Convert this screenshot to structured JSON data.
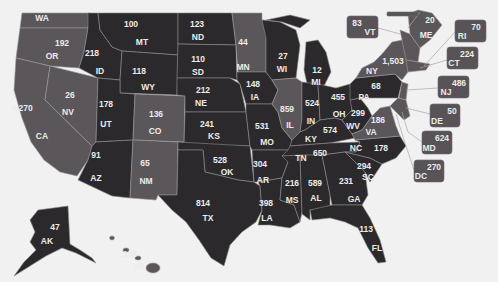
{
  "map": {
    "title": "US states value map",
    "colors": {
      "background": "#f1f1f1",
      "dark": "#2b292b",
      "medium": "#5a565a",
      "label": "#ececec"
    }
  },
  "states": {
    "WA": {
      "abbr": "WA"
    },
    "OR": {
      "abbr": "OR",
      "value": "192"
    },
    "CA": {
      "abbr": "CA",
      "value": "4,270"
    },
    "NV": {
      "abbr": "NV",
      "value": "26"
    },
    "ID": {
      "abbr": "ID",
      "value": "218"
    },
    "MT": {
      "abbr": "MT",
      "value": "100"
    },
    "WY": {
      "abbr": "WY",
      "value": "118"
    },
    "UT": {
      "abbr": "UT",
      "value": "178"
    },
    "CO": {
      "abbr": "CO",
      "value": "136"
    },
    "AZ": {
      "abbr": "AZ",
      "value": "91"
    },
    "NM": {
      "abbr": "NM",
      "value": "65"
    },
    "ND": {
      "abbr": "ND",
      "value": "123"
    },
    "SD": {
      "abbr": "SD",
      "value": "110"
    },
    "NE": {
      "abbr": "NE",
      "value": "212"
    },
    "KS": {
      "abbr": "KS",
      "value": "241"
    },
    "OK": {
      "abbr": "OK",
      "value": "528"
    },
    "TX": {
      "abbr": "TX",
      "value": "814"
    },
    "MN": {
      "abbr": "MN",
      "value": "44"
    },
    "IA": {
      "abbr": "IA",
      "value": "148"
    },
    "MO": {
      "abbr": "MO",
      "value": "531"
    },
    "AR": {
      "abbr": "AR",
      "value": "304"
    },
    "LA": {
      "abbr": "LA",
      "value": "398"
    },
    "WI": {
      "abbr": "WI",
      "value": "27"
    },
    "IL": {
      "abbr": "IL",
      "value": "859"
    },
    "MI": {
      "abbr": "MI",
      "value": "12"
    },
    "IN": {
      "abbr": "IN",
      "value": "524"
    },
    "KY": {
      "abbr": "KY",
      "value": "574"
    },
    "TN": {
      "abbr": "TN",
      "value": "650"
    },
    "MS": {
      "abbr": "MS",
      "value": "216"
    },
    "AL": {
      "abbr": "AL",
      "value": "589"
    },
    "GA": {
      "abbr": "GA",
      "value": "231"
    },
    "FL": {
      "abbr": "FL",
      "value": "113"
    },
    "OH": {
      "abbr": "OH",
      "value": "455"
    },
    "WV": {
      "abbr": "WV",
      "value": "299"
    },
    "VA": {
      "abbr": "VA",
      "value": "186"
    },
    "PA": {
      "abbr": "PA",
      "value": "68"
    },
    "NC": {
      "abbr": "NC",
      "value": "178"
    },
    "SC": {
      "abbr": "SC",
      "value": "294"
    },
    "NY": {
      "abbr": "NY",
      "value": "1,503"
    },
    "ME": {
      "abbr": "ME",
      "value": "20"
    },
    "VT": {
      "abbr": "VT",
      "value": "83"
    },
    "RI": {
      "abbr": "RI",
      "value": "70"
    },
    "CT": {
      "abbr": "CT",
      "value": "224"
    },
    "NJ": {
      "abbr": "NJ",
      "value": "486"
    },
    "DE": {
      "abbr": "DE",
      "value": "50"
    },
    "MD": {
      "abbr": "MD",
      "value": "624"
    },
    "DC": {
      "abbr": "DC",
      "value": "270"
    },
    "AK": {
      "abbr": "AK",
      "value": "47"
    },
    "HI": {
      "abbr": "HI",
      "value": "138"
    }
  }
}
